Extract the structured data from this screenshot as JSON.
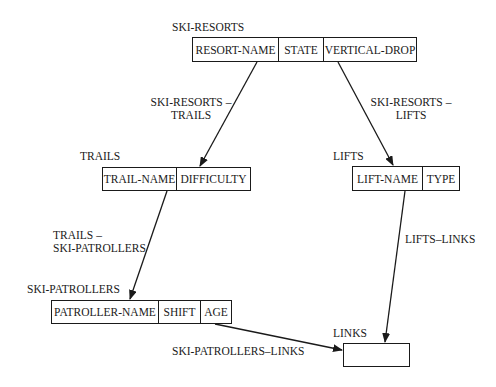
{
  "diagram": {
    "type": "network data model (record types and set types)",
    "records": [
      {
        "id": "ski_resorts",
        "name": "SKI-RESORTS",
        "fields": [
          "RESORT-NAME",
          "STATE",
          "VERTICAL-DROP"
        ]
      },
      {
        "id": "trails",
        "name": "TRAILS",
        "fields": [
          "TRAIL-NAME",
          "DIFFICULTY"
        ]
      },
      {
        "id": "lifts",
        "name": "LIFTS",
        "fields": [
          "LIFT-NAME",
          "TYPE"
        ]
      },
      {
        "id": "ski_patrollers",
        "name": "SKI-PATROLLERS",
        "fields": [
          "PATROLLER-NAME",
          "SHIFT",
          "AGE"
        ]
      },
      {
        "id": "links",
        "name": "LINKS",
        "fields": []
      }
    ],
    "sets": [
      {
        "id": "ski_resorts_trails",
        "label_line1": "SKI-RESORTS –",
        "label_line2": "TRAILS",
        "from": "SKI-RESORTS",
        "to": "TRAILS"
      },
      {
        "id": "ski_resorts_lifts",
        "label_line1": "SKI-RESORTS –",
        "label_line2": "LIFTS",
        "from": "SKI-RESORTS",
        "to": "LIFTS"
      },
      {
        "id": "trails_ski_patrollers",
        "label_line1": "TRAILS –",
        "label_line2": "SKI-PATROLLERS",
        "from": "TRAILS",
        "to": "SKI-PATROLLERS"
      },
      {
        "id": "lifts_links",
        "label_line1": "LIFTS–LINKS",
        "from": "LIFTS",
        "to": "LINKS"
      },
      {
        "id": "ski_patrollers_links",
        "label_line1": "SKI-PATROLLERS–LINKS",
        "from": "SKI-PATROLLERS",
        "to": "LINKS"
      }
    ]
  },
  "colors": {
    "line": "#1a1a1a",
    "background": "#ffffff"
  }
}
